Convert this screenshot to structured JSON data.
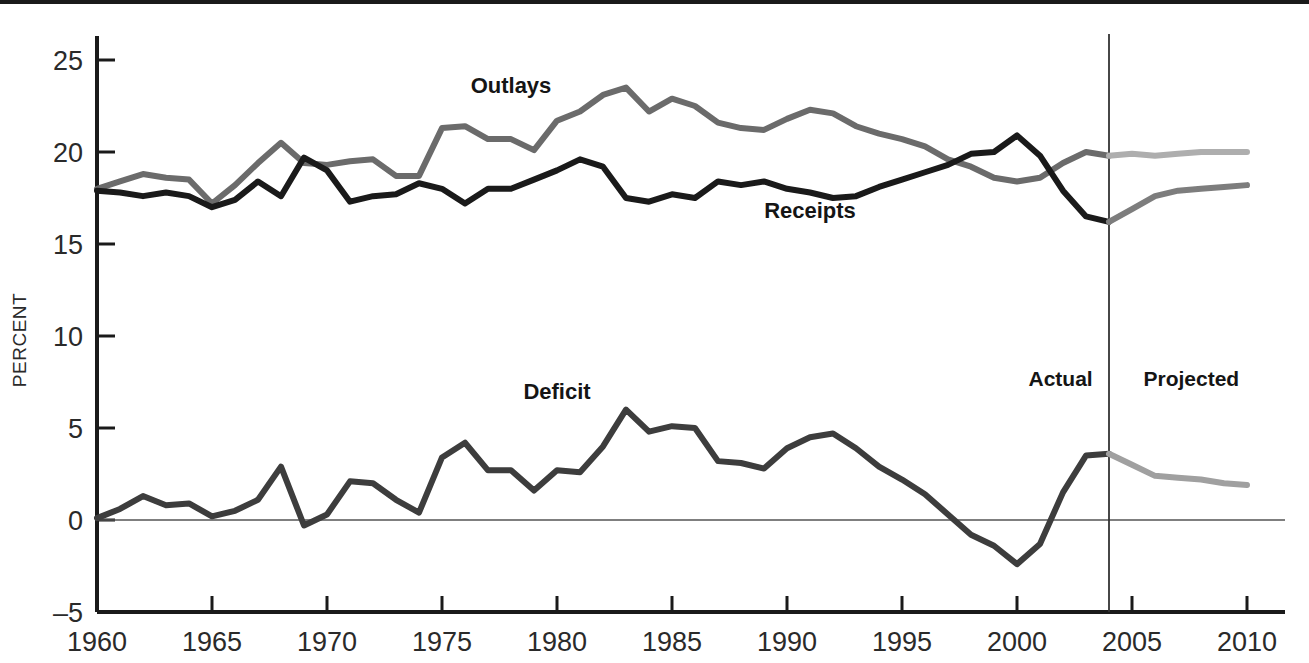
{
  "axes": {
    "y_title": "PERCENT",
    "y_ticks": [
      "25",
      "20",
      "15",
      "10",
      "5",
      "0",
      "-5"
    ],
    "x_ticks": [
      "1960",
      "1965",
      "1970",
      "1975",
      "1980",
      "1985",
      "1990",
      "1995",
      "2000",
      "2005",
      "2010"
    ]
  },
  "labels": {
    "outlays": "Outlays",
    "receipts": "Receipts",
    "deficit": "Deficit",
    "actual": "Actual",
    "projected": "Projected"
  },
  "colors": {
    "outlays_actual": "#6b6b6b",
    "outlays_projected": "#aeaeae",
    "receipts_actual": "#1a1a1a",
    "receipts_projected": "#7d7d7d",
    "deficit_actual": "#3d3d3d",
    "deficit_projected": "#a0a0a0",
    "axis": "#1a1a1a",
    "zero_line": "#555555",
    "divider": "#333333"
  },
  "chart_data": {
    "type": "line",
    "title": "",
    "xlabel": "",
    "ylabel": "PERCENT",
    "xlim": [
      1960,
      2010
    ],
    "ylim": [
      -5,
      25
    ],
    "grid": false,
    "legend": "inline-annotations",
    "actual_projected_split_year": 2004,
    "annotations": [
      {
        "text": "Outlays",
        "x": 1978,
        "y": 23.2
      },
      {
        "text": "Receipts",
        "x": 1991,
        "y": 16.4
      },
      {
        "text": "Deficit",
        "x": 1980,
        "y": 6.6
      },
      {
        "text": "Actual",
        "x": 2000.5,
        "y": 7.3
      },
      {
        "text": "Projected",
        "x": 2005.5,
        "y": 7.3
      }
    ],
    "x": [
      1960,
      1961,
      1962,
      1963,
      1964,
      1965,
      1966,
      1967,
      1968,
      1969,
      1970,
      1971,
      1972,
      1973,
      1974,
      1975,
      1976,
      1977,
      1978,
      1979,
      1980,
      1981,
      1982,
      1983,
      1984,
      1985,
      1986,
      1987,
      1988,
      1989,
      1990,
      1991,
      1992,
      1993,
      1994,
      1995,
      1996,
      1997,
      1998,
      1999,
      2000,
      2001,
      2002,
      2003,
      2004,
      2005,
      2006,
      2007,
      2008,
      2009,
      2010
    ],
    "series": [
      {
        "name": "Outlays",
        "color": "#6b6b6b",
        "projected_color": "#aeaeae",
        "values": [
          18.0,
          18.4,
          18.8,
          18.6,
          18.5,
          17.2,
          18.2,
          19.4,
          20.5,
          19.4,
          19.3,
          19.5,
          19.6,
          18.7,
          18.7,
          21.3,
          21.4,
          20.7,
          20.7,
          20.1,
          21.7,
          22.2,
          23.1,
          23.5,
          22.2,
          22.9,
          22.5,
          21.6,
          21.3,
          21.2,
          21.8,
          22.3,
          22.1,
          21.4,
          21.0,
          20.7,
          20.3,
          19.6,
          19.2,
          18.6,
          18.4,
          18.6,
          19.4,
          20.0,
          19.8,
          19.9,
          19.8,
          19.9,
          20.0,
          20.0,
          20.0
        ]
      },
      {
        "name": "Receipts",
        "color": "#1a1a1a",
        "projected_color": "#7d7d7d",
        "values": [
          17.9,
          17.8,
          17.6,
          17.8,
          17.6,
          17.0,
          17.4,
          18.4,
          17.6,
          19.7,
          19.0,
          17.3,
          17.6,
          17.7,
          18.3,
          18.0,
          17.2,
          18.0,
          18.0,
          18.5,
          19.0,
          19.6,
          19.2,
          17.5,
          17.3,
          17.7,
          17.5,
          18.4,
          18.2,
          18.4,
          18.0,
          17.8,
          17.5,
          17.6,
          18.1,
          18.5,
          18.9,
          19.3,
          19.9,
          20.0,
          20.9,
          19.8,
          17.9,
          16.5,
          16.2,
          16.9,
          17.6,
          17.9,
          18.0,
          18.1,
          18.2
        ]
      },
      {
        "name": "Deficit",
        "color": "#3d3d3d",
        "projected_color": "#a0a0a0",
        "values": [
          0.1,
          0.6,
          1.3,
          0.8,
          0.9,
          0.2,
          0.5,
          1.1,
          2.9,
          -0.3,
          0.3,
          2.1,
          2.0,
          1.1,
          0.4,
          3.4,
          4.2,
          2.7,
          2.7,
          1.6,
          2.7,
          2.6,
          4.0,
          6.0,
          4.8,
          5.1,
          5.0,
          3.2,
          3.1,
          2.8,
          3.9,
          4.5,
          4.7,
          3.9,
          2.9,
          2.2,
          1.4,
          0.3,
          -0.8,
          -1.4,
          -2.4,
          -1.3,
          1.5,
          3.5,
          3.6,
          3.0,
          2.4,
          2.3,
          2.2,
          2.0,
          1.9
        ]
      }
    ]
  }
}
